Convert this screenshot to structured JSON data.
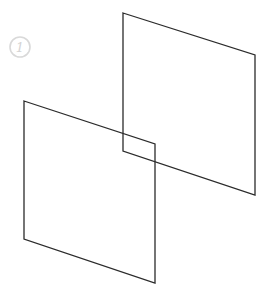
{
  "diagram": {
    "badge": {
      "label": "1",
      "cx": 20,
      "cy": 47,
      "r": 10,
      "color": "#d9d9d9"
    },
    "panels": [
      {
        "name": "back-panel",
        "points": "123,13 255,55 255,195 123,151"
      },
      {
        "name": "front-panel",
        "points": "24,101 155,144 155,283 24,239"
      }
    ],
    "stroke_color": "#2b2b2b"
  }
}
